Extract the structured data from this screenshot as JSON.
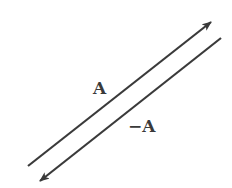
{
  "diagram": {
    "title": "",
    "vectors": [
      {
        "id": "A",
        "label": "A",
        "from": [
          28,
          166
        ],
        "to": [
          211,
          22
        ],
        "label_pos": [
          93,
          80
        ]
      },
      {
        "id": "neg-A",
        "label": "−A",
        "from": [
          221,
          38
        ],
        "to": [
          40,
          181
        ],
        "label_pos": [
          128,
          118
        ]
      }
    ],
    "colors": {
      "line": "#3a3a3a",
      "background": "#ffffff"
    }
  }
}
